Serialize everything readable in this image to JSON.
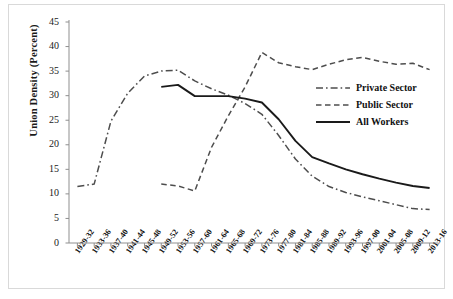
{
  "figure": {
    "cropped_title_fragment": "",
    "border_color": "#d9d9d9",
    "background": "#ffffff"
  },
  "axes": {
    "ylabel": "Union Density (Percent)",
    "yticks": [
      "0",
      "5",
      "10",
      "15",
      "20",
      "25",
      "30",
      "35",
      "40",
      "45"
    ],
    "xticks": [
      "1929-32",
      "1933-36",
      "1937-40",
      "1941-44",
      "1945-48",
      "1949-52",
      "1953-56",
      "1957-60",
      "1961-64",
      "1965-68",
      "1969-72",
      "1973-76",
      "1977-80",
      "1981-84",
      "1985-88",
      "1989-92",
      "1993-96",
      "1997-00",
      "2001-04",
      "2005-08",
      "2009-12",
      "2013-16"
    ]
  },
  "legend": {
    "position": "right-middle",
    "entries": [
      {
        "label": "Private Sector",
        "style": "dash-dot",
        "color": "#4d4d4d",
        "key": "private-sector-key"
      },
      {
        "label": "Public Sector",
        "style": "dashed",
        "color": "#4d4d4d",
        "key": "public-sector-key"
      },
      {
        "label": "All Workers",
        "style": "solid",
        "color": "#1a1a1a",
        "key": "all-workers-key"
      }
    ]
  },
  "chart_data": {
    "type": "line",
    "title": "",
    "xlabel": "",
    "ylabel": "Union Density (Percent)",
    "ylim": [
      0,
      45
    ],
    "ytick_step": 5,
    "grid": false,
    "legend_position": "right-middle",
    "categories": [
      "1929-32",
      "1933-36",
      "1937-40",
      "1941-44",
      "1945-48",
      "1949-52",
      "1953-56",
      "1957-60",
      "1961-64",
      "1965-68",
      "1969-72",
      "1973-76",
      "1977-80",
      "1981-84",
      "1985-88",
      "1989-92",
      "1993-96",
      "1997-00",
      "2001-04",
      "2005-08",
      "2009-12",
      "2013-16"
    ],
    "series": [
      {
        "name": "Private Sector",
        "style": "dash-dot",
        "color": "#4d4d4d",
        "values": [
          11.5,
          12.0,
          24.8,
          30.5,
          34.0,
          35.0,
          35.2,
          33.0,
          31.4,
          30.1,
          28.4,
          26.2,
          21.9,
          17.1,
          13.6,
          11.5,
          10.3,
          9.4,
          8.6,
          7.8,
          7.0,
          6.8
        ]
      },
      {
        "name": "Public Sector",
        "style": "dashed",
        "color": "#4d4d4d",
        "values": [
          null,
          null,
          null,
          null,
          null,
          12.0,
          11.6,
          10.6,
          19.5,
          25.9,
          31.8,
          38.8,
          36.7,
          35.9,
          35.3,
          36.4,
          37.3,
          37.8,
          37.0,
          36.4,
          36.6,
          35.3
        ]
      },
      {
        "name": "All Workers",
        "style": "solid",
        "color": "#1a1a1a",
        "values": [
          null,
          null,
          null,
          null,
          null,
          31.8,
          32.2,
          29.9,
          29.9,
          29.9,
          29.4,
          28.6,
          25.2,
          20.8,
          17.5,
          16.2,
          15.0,
          14.0,
          13.1,
          12.3,
          11.6,
          11.2
        ]
      }
    ]
  }
}
